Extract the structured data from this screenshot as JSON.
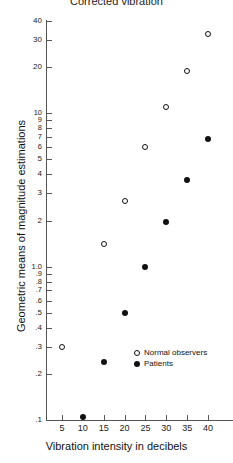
{
  "chart_data": {
    "type": "scatter",
    "title": "Corrected vibration",
    "xlabel": "Vibration intensity in decibels",
    "ylabel": "Geometric means of magnitude estimations",
    "xlim": [
      2.5,
      42.5
    ],
    "ylim": [
      0.1,
      40
    ],
    "yscale": "log",
    "grid": false,
    "legend_position": "inside-lower-right",
    "xticks": [
      5,
      10,
      15,
      20,
      25,
      30,
      35,
      40
    ],
    "xticklabels": [
      "5",
      "10",
      "15",
      "20",
      "25",
      "30",
      "35",
      "40"
    ],
    "yticks": [
      0.1,
      0.2,
      0.3,
      0.4,
      0.5,
      0.6,
      0.7,
      0.8,
      0.9,
      1.0,
      2,
      3,
      4,
      5,
      6,
      7,
      8,
      9,
      10,
      20,
      30,
      40
    ],
    "yticklabels": [
      ".1",
      ".2",
      ".3",
      ".4",
      ".5",
      ".6",
      ".7",
      ".8",
      ".9",
      "1.0",
      "2",
      "3",
      "4",
      "5",
      "6",
      "7",
      "8",
      "9",
      "10",
      "20",
      "30",
      "40"
    ],
    "series": [
      {
        "name": "Normal observers",
        "marker": "open-circle",
        "color": "#111111",
        "x": [
          5,
          15,
          20,
          25,
          30,
          35,
          40
        ],
        "y": [
          0.3,
          1.4,
          2.7,
          6.0,
          11.0,
          19.0,
          33.0
        ]
      },
      {
        "name": "Patients",
        "marker": "filled-circle",
        "color": "#111111",
        "x": [
          10,
          15,
          20,
          25,
          30,
          35,
          40
        ],
        "y": [
          0.105,
          0.24,
          0.5,
          1.0,
          1.95,
          3.7,
          6.8
        ]
      }
    ]
  },
  "legend": {
    "entries": [
      {
        "label": "Normal observers",
        "marker": "open-circle"
      },
      {
        "label": "Patients",
        "marker": "filled-circle"
      }
    ]
  }
}
